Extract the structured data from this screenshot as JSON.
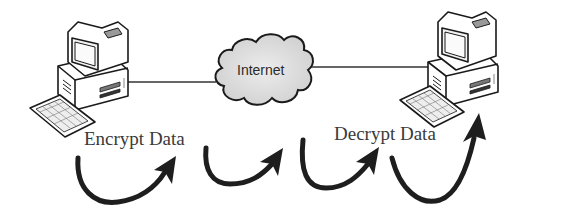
{
  "diagram": {
    "type": "encryption-over-network",
    "nodes": [
      {
        "id": "sender-computer",
        "kind": "desktop-computer",
        "position": "left"
      },
      {
        "id": "internet-cloud",
        "kind": "cloud",
        "label": "Internet",
        "position": "center"
      },
      {
        "id": "receiver-computer",
        "kind": "desktop-computer",
        "position": "right"
      }
    ],
    "connections": [
      {
        "from": "sender-computer",
        "to": "internet-cloud"
      },
      {
        "from": "internet-cloud",
        "to": "receiver-computer"
      }
    ],
    "labels": {
      "encrypt": "Encrypt Data",
      "decrypt": "Decrypt Data",
      "cloud": "Internet"
    },
    "flow_arrows": 4,
    "colors": {
      "line": "#333333",
      "arrow": "#1e1e1e",
      "cloud_fill": "#d9d9d9",
      "computer_fill": "#ffffff",
      "outline": "#1a1a1a",
      "text": "#3a3a3a"
    }
  }
}
